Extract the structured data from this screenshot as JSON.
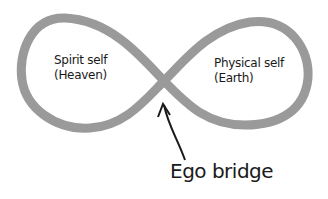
{
  "diagram": {
    "type": "infinity-loop",
    "loop_color": "#9a9a9a",
    "arrow_color": "#1a1a1a",
    "left_loop": {
      "line1": "Spirit self",
      "line2": "(Heaven)"
    },
    "right_loop": {
      "line1": "Physical self",
      "line2": "(Earth)"
    },
    "crossing_label": "Ego bridge"
  }
}
